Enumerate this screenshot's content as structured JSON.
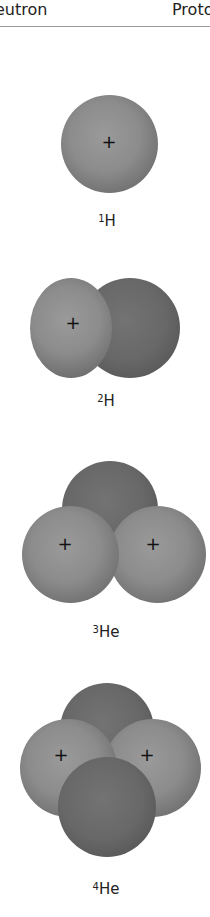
{
  "header": {
    "left_label": "Neutron",
    "right_label": "Proton"
  },
  "nuclei": [
    {
      "mass_number": "1",
      "symbol": "H",
      "protons": 1,
      "neutrons": 0
    },
    {
      "mass_number": "2",
      "symbol": "H",
      "protons": 1,
      "neutrons": 1
    },
    {
      "mass_number": "3",
      "symbol": "He",
      "protons": 2,
      "neutrons": 1
    },
    {
      "mass_number": "4",
      "symbol": "He",
      "protons": 2,
      "neutrons": 2
    }
  ],
  "symbols": {
    "proton_charge": "+"
  },
  "colors": {
    "proton": "#8c8c8c",
    "neutron": "#686868",
    "rule": "#9a9a9a"
  }
}
